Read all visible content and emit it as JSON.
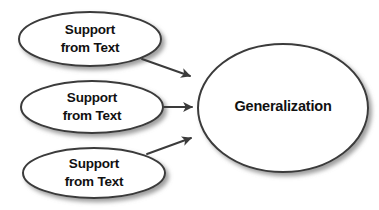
{
  "diagram": {
    "type": "concept-map",
    "background_color": "#ffffff",
    "stroke_color": "#3b3b3b",
    "text_color": "#111111",
    "shadow_color": "#9a9a9a",
    "nodes": [
      {
        "id": "support-1",
        "shape": "ellipse",
        "line1": "Support",
        "line2": "from Text",
        "cx": 90,
        "cy": 39,
        "rx": 71,
        "ry": 27
      },
      {
        "id": "support-2",
        "shape": "ellipse",
        "line1": "Support",
        "line2": "from Text",
        "cx": 92,
        "cy": 107,
        "rx": 71,
        "ry": 26
      },
      {
        "id": "support-3",
        "shape": "ellipse",
        "line1": "Support",
        "line2": "from Text",
        "cx": 94,
        "cy": 173,
        "rx": 71,
        "ry": 25
      },
      {
        "id": "generalization",
        "shape": "ellipse",
        "line1": "Generalization",
        "line2": "",
        "cx": 283,
        "cy": 108,
        "rx": 85,
        "ry": 64
      }
    ],
    "edges": [
      {
        "id": "edge-support1-generalization",
        "from": "support-1",
        "to": "generalization",
        "arrowhead": "filled-triangle",
        "x1": 142,
        "y1": 59,
        "x2": 194,
        "y2": 78
      },
      {
        "id": "edge-support2-generalization",
        "from": "support-2",
        "to": "generalization",
        "arrowhead": "filled-triangle",
        "x1": 164,
        "y1": 107,
        "x2": 196,
        "y2": 107
      },
      {
        "id": "edge-support3-generalization",
        "from": "support-3",
        "to": "generalization",
        "arrowhead": "filled-triangle",
        "x1": 147,
        "y1": 154,
        "x2": 195,
        "y2": 136
      }
    ]
  }
}
